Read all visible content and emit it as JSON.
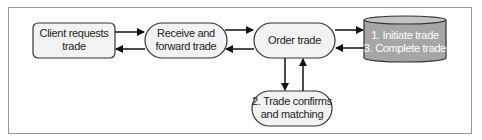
{
  "diagram": {
    "nodes": [
      {
        "id": "client",
        "shape": "rounded-rect",
        "lines": [
          "Client requests",
          "trade"
        ]
      },
      {
        "id": "receive",
        "shape": "stadium",
        "lines": [
          "Receive and",
          "forward trade"
        ]
      },
      {
        "id": "order",
        "shape": "stadium",
        "lines": [
          "Order trade"
        ]
      },
      {
        "id": "db",
        "shape": "cylinder",
        "lines": [
          "1. Initiate trade",
          "3. Complete trade"
        ]
      },
      {
        "id": "confirm",
        "shape": "stadium",
        "lines": [
          "2. Trade confirms",
          "and matching"
        ]
      }
    ],
    "edges": [
      {
        "from": "client",
        "to": "receive"
      },
      {
        "from": "receive",
        "to": "client"
      },
      {
        "from": "receive",
        "to": "order"
      },
      {
        "from": "order",
        "to": "receive"
      },
      {
        "from": "order",
        "to": "db"
      },
      {
        "from": "db",
        "to": "order"
      },
      {
        "from": "order",
        "to": "confirm"
      },
      {
        "from": "confirm",
        "to": "order"
      }
    ],
    "colors": {
      "node_fill": "#f2f2f2",
      "node_stroke": "#333333",
      "db_fill": "#a6a6a6",
      "db_top": "#c4c4c4",
      "db_text": "#ffffff",
      "arrow": "#111111",
      "frame": "#9a9a9a"
    }
  }
}
